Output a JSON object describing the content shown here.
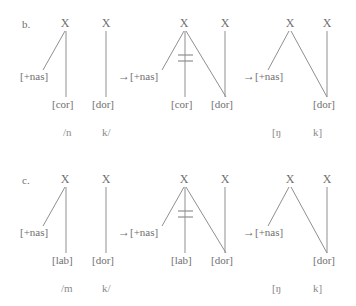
{
  "figure": {
    "type": "autosegmental-derivation"
  },
  "rows": [
    {
      "label": "b.",
      "input_transcription": "/n    k/",
      "input_left": "/n",
      "input_right": "k/",
      "output_left": "[ŋ",
      "output_right": "k]",
      "arrow": "→",
      "stages": [
        {
          "name": "underlying",
          "skeletal_slots": [
            "X",
            "X"
          ],
          "features": [
            "[+nas]",
            "[cor]",
            "[dor]"
          ]
        },
        {
          "name": "spreading",
          "skeletal_slots": [
            "X",
            "X"
          ],
          "features": [
            "[+nas]",
            "[cor]",
            "[dor]"
          ],
          "delinked_feature": "[cor]"
        },
        {
          "name": "surface",
          "skeletal_slots": [
            "X",
            "X"
          ],
          "features": [
            "[+nas]",
            "[dor]"
          ]
        }
      ]
    },
    {
      "label": "c.",
      "input_transcription": "/m    k/",
      "input_left": "/m",
      "input_right": "k/",
      "output_left": "[ŋ",
      "output_right": "k]",
      "arrow": "→",
      "stages": [
        {
          "name": "underlying",
          "skeletal_slots": [
            "X",
            "X"
          ],
          "features": [
            "[+nas]",
            "[lab]",
            "[dor]"
          ]
        },
        {
          "name": "spreading",
          "skeletal_slots": [
            "X",
            "X"
          ],
          "features": [
            "[+nas]",
            "[lab]",
            "[dor]"
          ],
          "delinked_feature": "[lab]"
        },
        {
          "name": "surface",
          "skeletal_slots": [
            "X",
            "X"
          ],
          "features": [
            "[+nas]",
            "[dor]"
          ]
        }
      ]
    }
  ],
  "colors": {
    "text": "#6f6f6f",
    "line": "#9a9a9a",
    "background": "#ffffff"
  }
}
